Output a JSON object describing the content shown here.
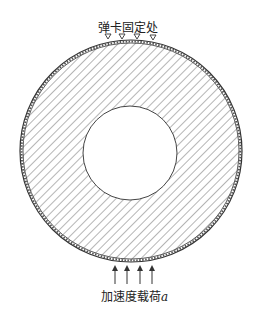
{
  "labels": {
    "clamp_location": "弹卡固定处",
    "acceleration_load": "加速度载荷",
    "acceleration_symbol": "a"
  },
  "geometry": {
    "outer_center": [
      131,
      151
    ],
    "outer_radius": 111,
    "inner_center": [
      130,
      153
    ],
    "inner_radius": 47,
    "clamp_x": [
      108,
      122,
      137,
      153
    ],
    "arrow_x": [
      115,
      127,
      140,
      152
    ]
  },
  "colors": {
    "line": "#333333",
    "hatch": "#777777",
    "background": "#ffffff"
  }
}
